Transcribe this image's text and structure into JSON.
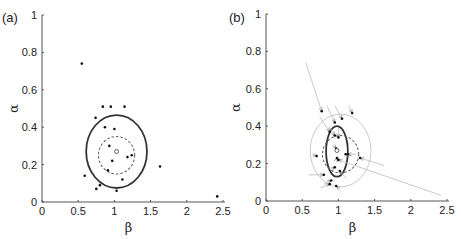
{
  "figure": {
    "panels": [
      "(a)",
      "(b)"
    ]
  },
  "chart_data": [
    {
      "panel_label": "(a)",
      "type": "scatter",
      "title": "",
      "xlabel": "β",
      "ylabel": "α",
      "xlim": [
        0,
        2.5
      ],
      "ylim": [
        0,
        1
      ],
      "xticks": [
        "0",
        "0.5",
        "1",
        "1.5",
        "2",
        "2.5"
      ],
      "yticks": [
        "0",
        "0.2",
        "0.4",
        "0.6",
        "0.8",
        "1"
      ],
      "grid": false,
      "legend": null,
      "points": [
        [
          0.55,
          0.74
        ],
        [
          0.84,
          0.51
        ],
        [
          0.95,
          0.51
        ],
        [
          1.14,
          0.51
        ],
        [
          0.74,
          0.45
        ],
        [
          0.87,
          0.4
        ],
        [
          1.0,
          0.39
        ],
        [
          0.93,
          0.3
        ],
        [
          1.18,
          0.24
        ],
        [
          1.24,
          0.25
        ],
        [
          0.97,
          0.22
        ],
        [
          0.91,
          0.17
        ],
        [
          1.63,
          0.19
        ],
        [
          0.59,
          0.14
        ],
        [
          1.11,
          0.12
        ],
        [
          0.8,
          0.09
        ],
        [
          0.75,
          0.07
        ],
        [
          1.03,
          0.06
        ],
        [
          2.42,
          0.03
        ]
      ],
      "mean_marker": [
        1.03,
        0.27
      ],
      "ellipses": [
        {
          "style": "solid",
          "color": "#333333",
          "center": [
            1.03,
            0.27
          ],
          "rx": 0.42,
          "ry": 0.195
        },
        {
          "style": "dashed",
          "color": "#666666",
          "center": [
            1.03,
            0.25
          ],
          "rx": 0.25,
          "ry": 0.1
        }
      ]
    },
    {
      "panel_label": "(b)",
      "type": "scatter",
      "title": "",
      "xlabel": "β",
      "ylabel": "α",
      "xlim": [
        0,
        2.5
      ],
      "ylim": [
        0,
        1
      ],
      "xticks": [
        "0",
        "0.5",
        "1",
        "1.5",
        "2",
        "2.5"
      ],
      "yticks": [
        "0",
        "0.2",
        "0.4",
        "0.6",
        "0.8",
        "1"
      ],
      "grid": false,
      "legend": null,
      "shrinkage": [
        {
          "from": [
            0.55,
            0.74
          ],
          "to": [
            0.77,
            0.48
          ]
        },
        {
          "from": [
            0.84,
            0.51
          ],
          "to": [
            0.95,
            0.42
          ]
        },
        {
          "from": [
            0.95,
            0.51
          ],
          "to": [
            1.05,
            0.44
          ]
        },
        {
          "from": [
            1.14,
            0.51
          ],
          "to": [
            1.19,
            0.47
          ]
        },
        {
          "from": [
            0.74,
            0.45
          ],
          "to": [
            0.88,
            0.37
          ]
        },
        {
          "from": [
            0.87,
            0.4
          ],
          "to": [
            0.95,
            0.35
          ]
        },
        {
          "from": [
            1.0,
            0.39
          ],
          "to": [
            1.0,
            0.34
          ]
        },
        {
          "from": [
            0.93,
            0.3
          ],
          "to": [
            0.97,
            0.28
          ]
        },
        {
          "from": [
            1.18,
            0.24
          ],
          "to": [
            1.1,
            0.25
          ]
        },
        {
          "from": [
            1.24,
            0.25
          ],
          "to": [
            1.13,
            0.25
          ]
        },
        {
          "from": [
            0.97,
            0.22
          ],
          "to": [
            0.98,
            0.23
          ]
        },
        {
          "from": [
            0.91,
            0.17
          ],
          "to": [
            0.95,
            0.18
          ]
        },
        {
          "from": [
            1.63,
            0.19
          ],
          "to": [
            1.3,
            0.23
          ]
        },
        {
          "from": [
            0.59,
            0.14
          ],
          "to": [
            0.8,
            0.14
          ]
        },
        {
          "from": [
            1.11,
            0.12
          ],
          "to": [
            1.02,
            0.16
          ]
        },
        {
          "from": [
            0.8,
            0.09
          ],
          "to": [
            0.9,
            0.11
          ]
        },
        {
          "from": [
            0.75,
            0.07
          ],
          "to": [
            0.88,
            0.09
          ]
        },
        {
          "from": [
            1.03,
            0.06
          ],
          "to": [
            0.97,
            0.08
          ]
        },
        {
          "from": [
            2.42,
            0.03
          ],
          "to": [
            1.0,
            0.22
          ]
        },
        {
          "from": [
            0.64,
            0.25
          ],
          "to": [
            0.7,
            0.24
          ]
        }
      ],
      "mean_marker": [
        0.98,
        0.27
      ],
      "ellipses": [
        {
          "style": "solid",
          "color": "#333333",
          "center": [
            0.98,
            0.265
          ],
          "rx": 0.15,
          "ry": 0.135
        },
        {
          "style": "dashed",
          "color": "#666666",
          "center": [
            1.03,
            0.25
          ],
          "rx": 0.25,
          "ry": 0.1
        },
        {
          "style": "solid-thin",
          "color": "#bbbbbb",
          "center": [
            1.03,
            0.27
          ],
          "rx": 0.42,
          "ry": 0.195
        }
      ]
    }
  ]
}
